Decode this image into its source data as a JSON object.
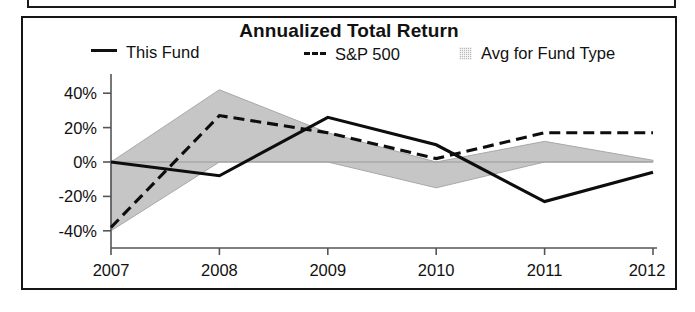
{
  "panel": {
    "title": "Annualized Total Return"
  },
  "legend": {
    "items": [
      {
        "label": "This Fund",
        "marker": "solid-line-swatch"
      },
      {
        "label": "S&P 500",
        "marker": "dashed-line-swatch"
      },
      {
        "label": "Avg for Fund Type",
        "marker": "shaded-area-swatch"
      }
    ]
  },
  "axes": {
    "y_ticks": [
      "40%",
      "20%",
      "0%",
      "-20%",
      "-40%"
    ],
    "x_ticks": [
      "2007",
      "2008",
      "2009",
      "2010",
      "2011",
      "2012"
    ],
    "x_suffix": "YTD"
  },
  "colors": {
    "line": "#0d0d0d",
    "band": "#c6c6c6",
    "axis": "#555555",
    "border": "#151515"
  },
  "chart_data": {
    "type": "line",
    "title": "Annualized Total Return",
    "xlabel": "",
    "ylabel": "",
    "categories": [
      "2007",
      "2008",
      "2009",
      "2010",
      "2011",
      "2012 YTD"
    ],
    "ylim": [
      -50,
      50
    ],
    "yticks": [
      -40,
      -20,
      0,
      20,
      40
    ],
    "ytick_labels": [
      "-40%",
      "-20%",
      "0%",
      "20%",
      "40%"
    ],
    "grid": false,
    "legend_position": "top",
    "series": [
      {
        "name": "This Fund",
        "style": "solid",
        "values": [
          0,
          -8,
          26,
          10,
          -23,
          -6
        ]
      },
      {
        "name": "S&P 500",
        "style": "dashed",
        "values": [
          -38,
          27,
          17,
          2,
          17,
          17
        ]
      },
      {
        "name": "Avg for Fund Type",
        "style": "shaded-band",
        "band_upper": [
          0,
          42,
          17,
          0,
          12,
          1
        ],
        "band_lower": [
          -40,
          0,
          0,
          -15,
          0,
          0
        ]
      }
    ]
  }
}
